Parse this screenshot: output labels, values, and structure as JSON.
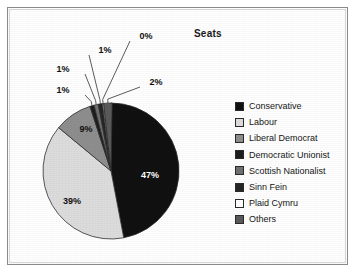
{
  "frame": {
    "border_color": "#8a8a8a"
  },
  "chart_data": {
    "type": "pie",
    "title": "Seats",
    "xlabel": "",
    "ylabel": "",
    "legend_position": "right",
    "grid": false,
    "categories": [
      "Conservative",
      "Labour",
      "Liberal Democrat",
      "Democratic Unionist",
      "Scottish Nationalist",
      "Sinn Fein",
      "Plaid Cymru",
      "Others"
    ],
    "values": [
      47,
      39,
      9,
      1,
      1,
      1,
      0,
      2
    ],
    "value_labels": [
      "47%",
      "39%",
      "9%",
      "1%",
      "1%",
      "1%",
      "0%",
      "2%"
    ],
    "colors": [
      "#111111",
      "#dcdcdc",
      "#8e8e8e",
      "#1d1d1d",
      "#707070",
      "#262626",
      "#ffffff",
      "#5a5a5a"
    ],
    "slices": [
      {
        "name": "Conservative",
        "label": "47%",
        "value": 47,
        "color": "#111111",
        "label_x": 135,
        "label_y": 163,
        "label_light": true,
        "callout": false
      },
      {
        "name": "Labour",
        "label": "39%",
        "value": 39,
        "color": "#dcdcdc",
        "label_x": 57,
        "label_y": 189,
        "label_light": false,
        "callout": false
      },
      {
        "name": "Liberal Democrat",
        "label": "9%",
        "value": 9,
        "color": "#8e8e8e",
        "label_x": 71,
        "label_y": 117,
        "label_light": false,
        "callout": false
      },
      {
        "name": "Democratic Unionist",
        "label": "1%",
        "value": 1,
        "color": "#1d1d1d",
        "label_x": 48,
        "label_y": 78,
        "label_light": false,
        "callout": true
      },
      {
        "name": "Scottish Nationalist",
        "label": "1%",
        "value": 1,
        "color": "#707070",
        "label_x": 48,
        "label_y": 57,
        "label_light": false,
        "callout": true
      },
      {
        "name": "Sinn Fein",
        "label": "1%",
        "value": 1,
        "color": "#262626",
        "label_x": 90,
        "label_y": 38,
        "label_light": false,
        "callout": true
      },
      {
        "name": "Plaid Cymru",
        "label": "0%",
        "value": 0,
        "color": "#ffffff",
        "label_x": 131,
        "label_y": 24,
        "label_light": false,
        "callout": true
      },
      {
        "name": "Others",
        "label": "2%",
        "value": 2,
        "color": "#5a5a5a",
        "label_x": 141,
        "label_y": 70,
        "label_light": false,
        "callout": true
      }
    ]
  },
  "legend": {
    "items": [
      {
        "label": "Conservative",
        "color": "#111111"
      },
      {
        "label": "Labour",
        "color": "#dcdcdc"
      },
      {
        "label": "Liberal Democrat",
        "color": "#8e8e8e"
      },
      {
        "label": "Democratic Unionist",
        "color": "#1d1d1d"
      },
      {
        "label": "Scottish Nationalist",
        "color": "#707070"
      },
      {
        "label": "Sinn Fein",
        "color": "#262626"
      },
      {
        "label": "Plaid Cymru",
        "color": "#ffffff"
      },
      {
        "label": "Others",
        "color": "#5a5a5a"
      }
    ]
  }
}
